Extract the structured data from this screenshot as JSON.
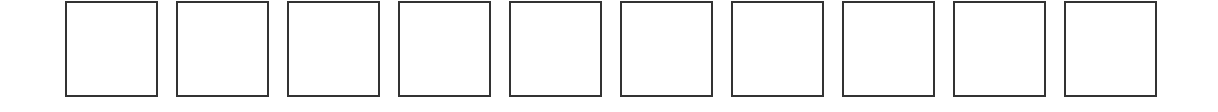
{
  "boxes": [
    {
      "index": 1,
      "content": ""
    },
    {
      "index": 2,
      "content": ""
    },
    {
      "index": 3,
      "content": ""
    },
    {
      "index": 4,
      "content": ""
    },
    {
      "index": 5,
      "content": ""
    },
    {
      "index": 6,
      "content": ""
    },
    {
      "index": 7,
      "content": ""
    },
    {
      "index": 8,
      "content": ""
    },
    {
      "index": 9,
      "content": ""
    },
    {
      "index": 10,
      "content": ""
    }
  ],
  "colors": {
    "border": "#333333",
    "background": "#ffffff"
  }
}
